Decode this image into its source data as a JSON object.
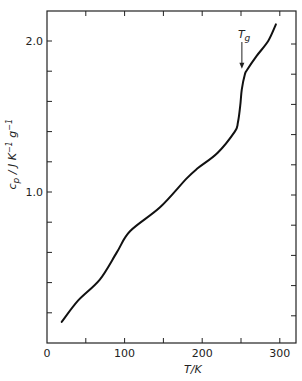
{
  "chart_data": {
    "type": "line",
    "title": "",
    "xlabel": "T/K",
    "ylabel": "c_p / J K^-1 g^-1",
    "xlim": [
      0,
      322
    ],
    "ylim": [
      0,
      2.2
    ],
    "grid": false,
    "legend": null,
    "x_ticks": [
      {
        "value": 0,
        "label": "0"
      },
      {
        "value": 50,
        "label": ""
      },
      {
        "value": 100,
        "label": "100"
      },
      {
        "value": 150,
        "label": ""
      },
      {
        "value": 200,
        "label": "200"
      },
      {
        "value": 250,
        "label": ""
      },
      {
        "value": 300,
        "label": "300"
      }
    ],
    "y_ticks": [
      {
        "value": 0.2,
        "label": ""
      },
      {
        "value": 0.4,
        "label": ""
      },
      {
        "value": 0.6,
        "label": ""
      },
      {
        "value": 0.8,
        "label": ""
      },
      {
        "value": 1.0,
        "label": "1.0"
      },
      {
        "value": 1.2,
        "label": ""
      },
      {
        "value": 1.4,
        "label": ""
      },
      {
        "value": 1.6,
        "label": ""
      },
      {
        "value": 1.8,
        "label": ""
      },
      {
        "value": 2.0,
        "label": "2.0"
      }
    ],
    "series": [
      {
        "name": "c_p",
        "x": [
          19,
          40,
          68,
          90,
          107,
          146,
          180,
          195,
          220,
          242,
          246,
          249,
          251,
          255,
          258,
          270,
          285,
          295
        ],
        "y": [
          0.14,
          0.28,
          0.42,
          0.6,
          0.74,
          0.9,
          1.09,
          1.16,
          1.26,
          1.4,
          1.46,
          1.57,
          1.68,
          1.78,
          1.81,
          1.9,
          2.0,
          2.11
        ]
      }
    ],
    "annotations": [
      {
        "text": "T",
        "subscript": "g",
        "x": 255,
        "y": 1.81,
        "type": "arrow-down"
      }
    ]
  }
}
